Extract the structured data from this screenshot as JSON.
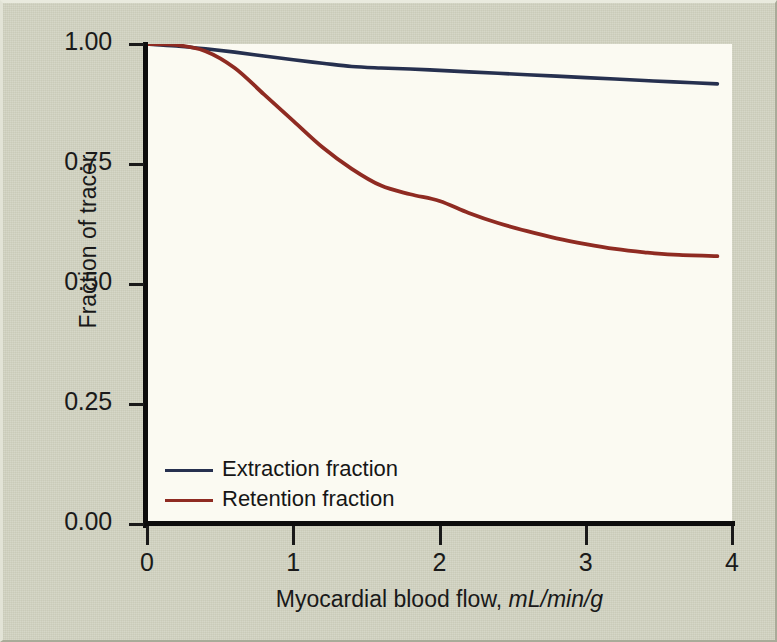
{
  "chart_data": {
    "type": "line",
    "title": "",
    "xlabel_plain": "Myocardial blood flow, ",
    "xlabel_units": "mL/min/g",
    "ylabel": "Fraction of tracer",
    "xlim": [
      0,
      4
    ],
    "ylim": [
      0,
      1.0
    ],
    "xticks": [
      "0",
      "1",
      "2",
      "3",
      "4"
    ],
    "xtick_values": [
      0,
      1,
      2,
      3,
      4
    ],
    "yticks": [
      "0.00",
      "0.25",
      "0.50",
      "0.75",
      "1.00"
    ],
    "ytick_values": [
      0,
      0.25,
      0.5,
      0.75,
      1.0
    ],
    "grid": false,
    "legend_position": "inside-bottom-left",
    "x_data_range": [
      0,
      3.9
    ],
    "series": [
      {
        "name": "Extraction fraction",
        "color": "#26304f",
        "x": [
          0,
          0.2,
          0.4,
          0.6,
          0.8,
          1.0,
          1.2,
          1.4,
          1.6,
          1.8,
          2.0,
          2.2,
          2.4,
          2.6,
          2.8,
          3.0,
          3.2,
          3.4,
          3.6,
          3.9
        ],
        "values": [
          1.0,
          0.996,
          0.99,
          0.983,
          0.975,
          0.967,
          0.96,
          0.953,
          0.95,
          0.948,
          0.945,
          0.942,
          0.939,
          0.936,
          0.933,
          0.93,
          0.927,
          0.924,
          0.921,
          0.917
        ]
      },
      {
        "name": "Retention fraction",
        "color": "#8f2b22",
        "x": [
          0,
          0.2,
          0.4,
          0.6,
          0.8,
          1.0,
          1.2,
          1.4,
          1.6,
          1.8,
          2.0,
          2.2,
          2.4,
          2.6,
          2.8,
          3.0,
          3.2,
          3.4,
          3.6,
          3.9
        ],
        "values": [
          1.0,
          0.998,
          0.985,
          0.95,
          0.895,
          0.84,
          0.785,
          0.74,
          0.705,
          0.687,
          0.673,
          0.648,
          0.627,
          0.61,
          0.595,
          0.583,
          0.573,
          0.566,
          0.561,
          0.558
        ]
      }
    ]
  },
  "legend": {
    "items": [
      {
        "label": "Extraction fraction",
        "color": "#26304f"
      },
      {
        "label": "Retention fraction",
        "color": "#8f2b22"
      }
    ]
  }
}
